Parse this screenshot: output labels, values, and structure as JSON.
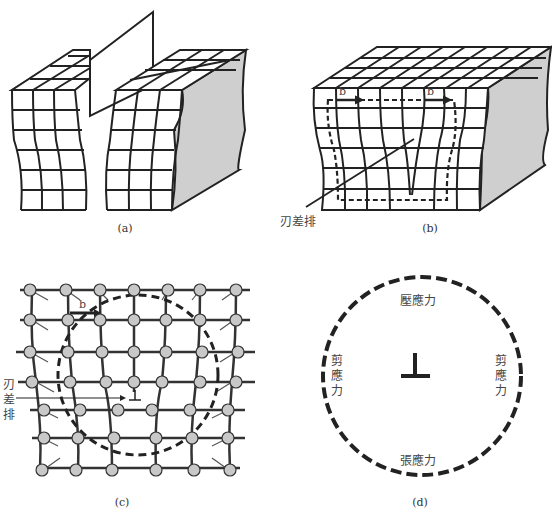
{
  "figure": {
    "panels": [
      {
        "id": "a",
        "caption": "(a)"
      },
      {
        "id": "b",
        "caption": "(b)",
        "burgers_labels": [
          "b",
          "b"
        ],
        "pointer_label": "刃差排"
      },
      {
        "id": "c",
        "caption": "(c)",
        "burgers_label": "b",
        "pointer_label": "刃差排",
        "symbol": "⊥"
      },
      {
        "id": "d",
        "caption": "(d)",
        "symbol": "⊥",
        "labels": {
          "top": "壓應力",
          "bottom": "張應力",
          "left": "剪應力",
          "right": "剪應力"
        }
      }
    ],
    "colors": {
      "line": "#222222",
      "shade": "#cfcfcf",
      "atom": "#c8c8c8"
    }
  }
}
